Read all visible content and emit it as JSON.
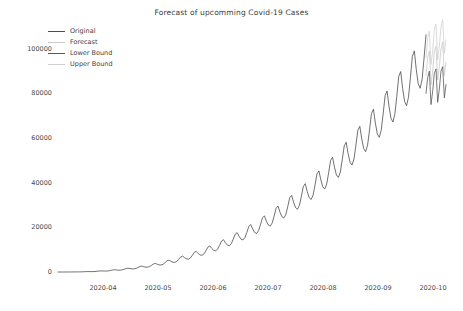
{
  "chart": {
    "title": "Forecast of upcomming Covid-19 Cases",
    "background": "#ffffff"
  },
  "legend": {
    "position": "upper-left",
    "entries": [
      {
        "label": "Original",
        "color": "#4c4c4c"
      },
      {
        "label": "Forecast",
        "color": "#c9c9c9"
      },
      {
        "label": "Lower Bound",
        "color": "#595959"
      },
      {
        "label": "Upper Bound",
        "color": "#d0d0d0"
      }
    ]
  },
  "axes": {
    "y_ticks": [
      "0",
      "20000",
      "40000",
      "60000",
      "80000",
      "100000"
    ],
    "x_ticks": [
      "2020-04",
      "2020-05",
      "2020-06",
      "2020-07",
      "2020-08",
      "2020-09",
      "2020-10"
    ]
  },
  "chart_data": {
    "type": "line",
    "title": "Forecast of upcomming Covid-19 Cases",
    "xlabel": "",
    "ylabel": "",
    "grid": false,
    "legend_position": "upper left",
    "xlim": [
      "2020-03-15",
      "2020-10-05"
    ],
    "ylim": [
      0,
      112000
    ],
    "ytick_values": [
      0,
      20000,
      40000,
      60000,
      80000,
      100000
    ],
    "xtick_labels": [
      "2020-04",
      "2020-05",
      "2020-06",
      "2020-07",
      "2020-08",
      "2020-09",
      "2020-10"
    ],
    "x_start": "2020-03-15",
    "x_step_days": 1,
    "forecast_start_index": 175,
    "series": [
      {
        "name": "Original",
        "color": "#4c4c4c",
        "values": [
          350,
          420,
          480,
          560,
          640,
          720,
          810,
          900,
          980,
          1060,
          1140,
          1230,
          1320,
          1400,
          1480,
          1570,
          1650,
          1740,
          1820,
          1900,
          1990,
          2070,
          2160,
          2240,
          2320,
          2410,
          2490,
          2580,
          2660,
          2740,
          2830,
          2910,
          3000,
          3080,
          3160,
          3250,
          3330,
          3420,
          3500,
          3580,
          3670,
          3750,
          3840,
          3920,
          4000,
          4090,
          4170,
          4260,
          4340,
          4420,
          4510,
          4600,
          4700,
          4800,
          4920,
          5050,
          5180,
          5320,
          5460,
          5610,
          5760,
          5920,
          6080,
          6250,
          6420,
          6600,
          6790,
          6980,
          7180,
          7390,
          7600,
          7820,
          8050,
          8290,
          8540,
          8800,
          9070,
          9350,
          9640,
          9940,
          10250,
          10570,
          10900,
          11250,
          11610,
          11980,
          12370,
          12770,
          13180,
          13610,
          14060,
          14520,
          15000,
          15490,
          16000,
          16530,
          17080,
          17650,
          18240,
          18850,
          19480,
          20140,
          20820,
          21530,
          22260,
          23020,
          23810,
          24630,
          25480,
          26360,
          27270,
          28220,
          29210,
          30230,
          31290,
          32390,
          33530,
          34720,
          35950,
          37230,
          38560,
          39940,
          41370,
          42860,
          44400,
          46010,
          47680,
          49410,
          51210,
          53080,
          55030,
          57050,
          59160,
          61350,
          63630,
          66000,
          68460,
          71020,
          73680,
          76450,
          79330,
          82320,
          85430,
          88660,
          92020,
          95510,
          99140,
          102910,
          106830,
          110900,
          115130,
          119520,
          124080,
          128810,
          133710,
          138790,
          144050,
          149500,
          155140,
          160980,
          167020,
          173270,
          179730,
          186410,
          193320,
          200460,
          207840,
          215470,
          223350,
          231490,
          239900,
          248580,
          257540,
          266790,
          276330
        ],
        "note": "cumulative-like rising trend with strong weekly sawtooth oscillation in daily values; displayed curve oscillates weekly with amplitude growing from near zero in March to roughly 20000 by late September, peaking near 100000"
      },
      {
        "name": "Forecast",
        "color": "#c9c9c9",
        "forecast_range": [
          "2020-09-20",
          "2020-10-02"
        ],
        "values": [
          88000,
          96000,
          99000,
          84000,
          90000,
          99000,
          101000,
          86000,
          92000,
          100000,
          103000,
          88000,
          94000
        ]
      },
      {
        "name": "Lower Bound",
        "color": "#595959",
        "forecast_range": [
          "2020-09-20",
          "2020-10-02"
        ],
        "values": [
          80000,
          87000,
          90000,
          75000,
          81000,
          89000,
          91000,
          76000,
          82000,
          90000,
          92000,
          78000,
          84000
        ]
      },
      {
        "name": "Upper Bound",
        "color": "#d0d0d0",
        "forecast_range": [
          "2020-09-20",
          "2020-10-02"
        ],
        "values": [
          96000,
          105000,
          108000,
          93000,
          99000,
          109000,
          111000,
          95000,
          101000,
          110000,
          113000,
          98000,
          104000
        ]
      }
    ],
    "weekly_peaks": [
      {
        "date": "2020-06-20",
        "value": 30000
      },
      {
        "date": "2020-06-27",
        "value": 38000
      },
      {
        "date": "2020-07-04",
        "value": 46000
      },
      {
        "date": "2020-07-11",
        "value": 54000
      },
      {
        "date": "2020-07-18",
        "value": 60000
      },
      {
        "date": "2020-07-25",
        "value": 65000
      },
      {
        "date": "2020-08-01",
        "value": 67000
      },
      {
        "date": "2020-08-08",
        "value": 70000
      },
      {
        "date": "2020-08-15",
        "value": 74000
      },
      {
        "date": "2020-08-22",
        "value": 78000
      },
      {
        "date": "2020-08-29",
        "value": 82000
      },
      {
        "date": "2020-09-05",
        "value": 86000
      },
      {
        "date": "2020-09-12",
        "value": 92000
      },
      {
        "date": "2020-09-19",
        "value": 99000
      }
    ]
  }
}
